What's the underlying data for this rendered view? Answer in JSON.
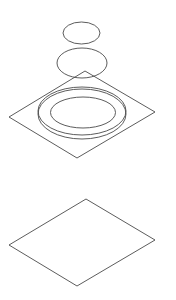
{
  "diagram": {
    "type": "exploded-isometric-view",
    "canvas": {
      "width": 176,
      "height": 300
    },
    "stroke_color": "#4a4a4a",
    "background_color": "#ffffff",
    "parts": [
      {
        "id": "top-small-disc",
        "shape": "ellipse",
        "cx": 81.5,
        "cy": 33,
        "rx": 18.5,
        "ry": 11
      },
      {
        "id": "middle-disc",
        "shape": "ellipse",
        "cx": 82,
        "cy": 63,
        "rx": 25,
        "ry": 15
      },
      {
        "id": "upper-plate",
        "shape": "rhombus",
        "points": [
          [
            85,
            71
          ],
          [
            155,
            112
          ],
          [
            77,
            158
          ],
          [
            9,
            117
          ]
        ]
      },
      {
        "id": "ring-base-lower",
        "shape": "ellipse",
        "cx": 82,
        "cy": 114,
        "rx": 44,
        "ry": 25
      },
      {
        "id": "ring-base-upper",
        "shape": "ellipse",
        "cx": 82,
        "cy": 111,
        "rx": 44,
        "ry": 24
      },
      {
        "id": "ring-inner",
        "shape": "ellipse",
        "cx": 83,
        "cy": 112.5,
        "rx": 32.5,
        "ry": 15.5
      },
      {
        "id": "lower-plate",
        "shape": "rhombus",
        "points": [
          [
            86,
            199
          ],
          [
            155,
            240
          ],
          [
            77,
            286
          ],
          [
            9,
            245
          ]
        ]
      }
    ]
  }
}
